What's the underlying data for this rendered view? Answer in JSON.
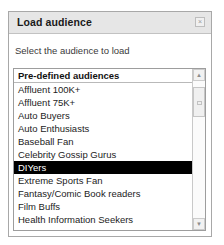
{
  "dialog": {
    "title": "Load audience",
    "close_label": "×",
    "instruction": "Select the audience to load",
    "accent_selection_color": "#000000",
    "titlebar_color": "#e6e6e6"
  },
  "list": {
    "group_header": "Pre-defined audiences",
    "selected": "DIYers",
    "items": [
      {
        "label": "Affluent 100K+",
        "selected": false
      },
      {
        "label": "Affluent 75K+",
        "selected": false
      },
      {
        "label": "Auto Buyers",
        "selected": false
      },
      {
        "label": "Auto Enthusiasts",
        "selected": false
      },
      {
        "label": "Baseball Fan",
        "selected": false
      },
      {
        "label": "Celebrity Gossip Gurus",
        "selected": false
      },
      {
        "label": "DIYers",
        "selected": true
      },
      {
        "label": "Extreme Sports Fan",
        "selected": false
      },
      {
        "label": "Fantasy/Comic Book readers",
        "selected": false
      },
      {
        "label": "Film Buffs",
        "selected": false
      },
      {
        "label": "Health Information Seekers",
        "selected": false
      },
      {
        "label": "Home Buyers",
        "selected": false
      }
    ]
  },
  "scrollbar": {
    "up_arrow": "▲",
    "down_arrow": "▼"
  }
}
